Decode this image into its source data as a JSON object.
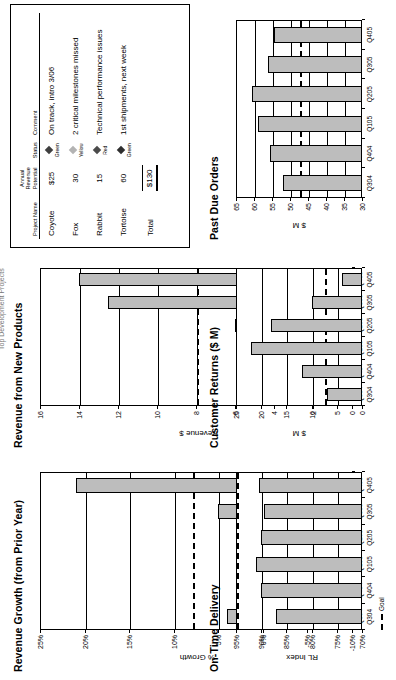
{
  "page": {
    "header_title": "Top Development Projects"
  },
  "table": {
    "name": "top-development-projects",
    "columns": [
      "Project Name",
      "Annual Revenue Potential",
      "Status",
      "Comment"
    ],
    "rows": [
      {
        "project": "Coyote",
        "revenue": "$25",
        "status": "Green",
        "status_color": "#3f3f3f",
        "comment": "On track, intro 3/06"
      },
      {
        "project": "Fox",
        "revenue": "30",
        "status": "Yellow",
        "status_color": "#b3b3b3",
        "comment": "2 critical milestones missed"
      },
      {
        "project": "Rabbit",
        "revenue": "15",
        "status": "Red",
        "status_color": "#4a4a4a",
        "comment": "Technical performance issues"
      },
      {
        "project": "Tortoise",
        "revenue": "60",
        "status": "Green",
        "status_color": "#2e2e2e",
        "comment": "1st shipments, next week"
      }
    ],
    "total_label": "Total",
    "total_value": "$130"
  },
  "chart_data": [
    {
      "id": "revenue-growth",
      "type": "bar",
      "title": "Revenue Growth (from Prior Year)",
      "ylabel": "% Growth",
      "xlabel": "",
      "categories": [
        "Q304",
        "Q404",
        "Q105",
        "Q205",
        "Q305",
        "Q405"
      ],
      "values": [
        4,
        3,
        -3.5,
        2,
        5,
        21
      ],
      "ylim": [
        -10,
        25
      ],
      "yticks": [
        25,
        20,
        15,
        10,
        5,
        0,
        -5,
        -10
      ],
      "ytick_labels": [
        "25%",
        "20%",
        "15%",
        "10%",
        "5%",
        "0%",
        "-5%",
        "-10%"
      ],
      "goal": 8,
      "goal_label": "Goal",
      "grid": true,
      "legend": "none"
    },
    {
      "id": "revenue-new-products",
      "type": "bar",
      "title": "Revenue from New Products",
      "ylabel": "Revenue $",
      "xlabel": "",
      "categories": [
        "Q304",
        "Q404",
        "Q105",
        "Q205",
        "Q305",
        "Q405"
      ],
      "values": [
        3,
        4.5,
        5,
        6,
        12.5,
        14
      ],
      "ylim": [
        0,
        16
      ],
      "yticks": [
        16,
        14,
        12,
        10,
        8,
        6,
        4,
        2,
        0
      ],
      "ytick_labels": [
        "16",
        "14",
        "12",
        "10",
        "8",
        "6",
        "4",
        "2",
        "0"
      ],
      "goal": 8,
      "goal_label": "Goal",
      "grid": true,
      "legend": "none"
    },
    {
      "id": "on-time-delivery",
      "type": "bar",
      "title": "On-Time Delivery",
      "ylabel": "RL Index",
      "xlabel": "",
      "categories": [
        "Q304",
        "Q404",
        "Q105",
        "Q205",
        "Q305",
        "Q405"
      ],
      "values": [
        87,
        90,
        91,
        90,
        89.5,
        90.5
      ],
      "ylim": [
        70,
        95
      ],
      "yticks": [
        95,
        90,
        85,
        80,
        75,
        70
      ],
      "ytick_labels": [
        "95%",
        "90%",
        "85%",
        "80%",
        "75%",
        "70%"
      ],
      "goal": 95,
      "goal_label": "Goal",
      "grid": true,
      "legend": "bottom"
    },
    {
      "id": "customer-returns",
      "type": "bar",
      "title": "Customer Returns ($ M)",
      "ylabel": "$ M",
      "xlabel": "",
      "categories": [
        "Q304",
        "Q404",
        "Q105",
        "Q205",
        "Q305",
        "Q405"
      ],
      "values": [
        7,
        12,
        22,
        18,
        10,
        4
      ],
      "ylim": [
        0,
        25
      ],
      "yticks": [
        25,
        20,
        15,
        10,
        5,
        0
      ],
      "ytick_labels": [
        "25",
        "20",
        "15",
        "10",
        "5",
        "0"
      ],
      "goal": 7.5,
      "goal_label": "Goal",
      "grid": true,
      "legend": "none"
    },
    {
      "id": "past-due-orders",
      "type": "bar",
      "title": "Past Due Orders",
      "ylabel": "$ M",
      "xlabel": "",
      "categories": [
        "Q304",
        "Q404",
        "Q105",
        "Q205",
        "Q305",
        "Q405"
      ],
      "values": [
        52,
        55.5,
        59,
        60.5,
        56,
        54.5
      ],
      "ylim": [
        30,
        65
      ],
      "yticks": [
        65,
        60,
        55,
        50,
        45,
        40,
        35,
        30
      ],
      "ytick_labels": [
        "65",
        "60",
        "55",
        "50",
        "45",
        "40",
        "35",
        "30"
      ],
      "goal": 47.5,
      "goal_label": "Goal",
      "grid": true,
      "legend": "none"
    }
  ]
}
